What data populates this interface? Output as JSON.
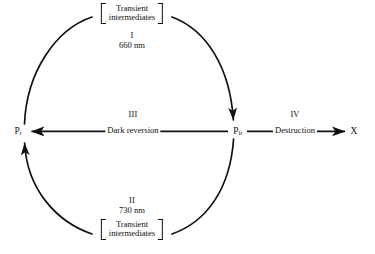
{
  "diagram": {
    "stroke_color": "#111111",
    "background_color": "#ffffff",
    "nodes": {
      "pr": {
        "symbol": "P",
        "subscript": "r",
        "full": "Pr"
      },
      "pfr": {
        "symbol": "P",
        "subscript": "fr",
        "full": "Pfr"
      },
      "x": {
        "label": "X"
      }
    },
    "top_group": {
      "bracket_line1": "Transient",
      "bracket_line2": "intermediates",
      "roman": "I",
      "wavelength": "660 nm",
      "bracket_open": "[",
      "bracket_close": "]"
    },
    "bottom_group": {
      "roman": "II",
      "wavelength": "730 nm",
      "bracket_line1": "Transient",
      "bracket_line2": "intermediates",
      "bracket_open": "[",
      "bracket_close": "]"
    },
    "dark_reversion": {
      "roman": "III",
      "label": "Dark reversion"
    },
    "destruction": {
      "roman": "IV",
      "label": "Destruction"
    }
  }
}
